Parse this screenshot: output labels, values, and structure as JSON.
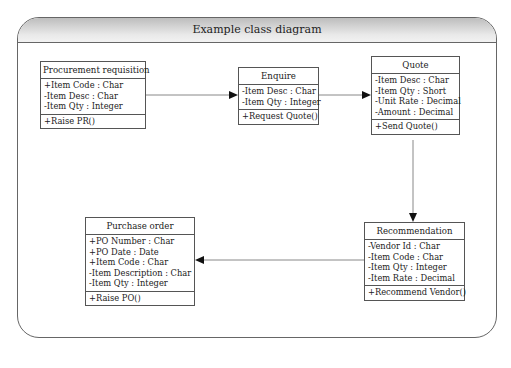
{
  "diagram": {
    "title": "Example class diagram",
    "classes": [
      {
        "name": "Procurement requisition",
        "attributes": [
          "+Item Code : Char",
          "-Item Desc : Char",
          "-Item Qty : Integer"
        ],
        "operations": [
          "+Raise PR()"
        ]
      },
      {
        "name": "Enquire",
        "attributes": [
          "-Item Desc : Char",
          "-Item Qty : Integer"
        ],
        "operations": [
          "+Request Quote()"
        ]
      },
      {
        "name": "Quote",
        "attributes": [
          "-Item Desc : Char",
          "-Item Qty : Short",
          "-Unit Rate : Decimal",
          "-Amount : Decimal"
        ],
        "operations": [
          "+Send Quote()"
        ]
      },
      {
        "name": "Recommendation",
        "attributes": [
          "-Vendor Id : Char",
          "-Item Code : Char",
          "-Item Qty : Integer",
          "-Item Rate : Decimal"
        ],
        "operations": [
          "+Recommend Vendor()"
        ]
      },
      {
        "name": "Purchase order",
        "attributes": [
          "+PO Number : Char",
          "+PO Date : Date",
          "+Item Code : Char",
          "-Item Description : Char",
          "-Item Qty : Integer"
        ],
        "operations": [
          "+Raise PO()"
        ]
      }
    ],
    "connections": [
      {
        "from": "Procurement requisition",
        "to": "Enquire"
      },
      {
        "from": "Enquire",
        "to": "Quote"
      },
      {
        "from": "Quote",
        "to": "Recommendation"
      },
      {
        "from": "Recommendation",
        "to": "Purchase order"
      }
    ]
  }
}
